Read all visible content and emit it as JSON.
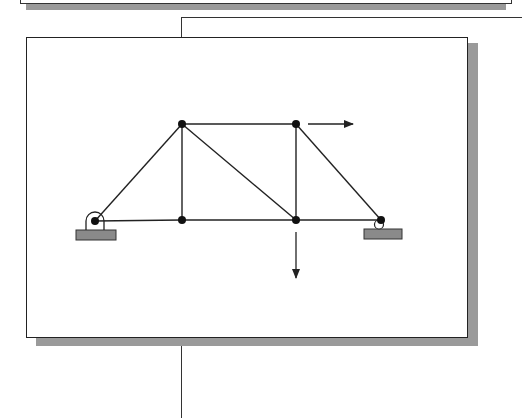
{
  "diagram": {
    "type": "truss",
    "colors": {
      "member": "#222222",
      "node": "#111111",
      "support": "#8a8a8a",
      "shadow": "#9a9a9a",
      "arrow": "#222222"
    },
    "nodes": [
      {
        "id": "A",
        "x": 95,
        "y": 221,
        "role": "pin-support"
      },
      {
        "id": "B",
        "x": 182,
        "y": 124
      },
      {
        "id": "C",
        "x": 182,
        "y": 220
      },
      {
        "id": "D",
        "x": 296,
        "y": 124
      },
      {
        "id": "E",
        "x": 296,
        "y": 220
      },
      {
        "id": "F",
        "x": 381,
        "y": 220,
        "role": "roller-support"
      }
    ],
    "members": [
      [
        "A",
        "B"
      ],
      [
        "A",
        "C"
      ],
      [
        "B",
        "C"
      ],
      [
        "B",
        "D"
      ],
      [
        "B",
        "E"
      ],
      [
        "C",
        "E"
      ],
      [
        "D",
        "E"
      ],
      [
        "D",
        "F"
      ],
      [
        "E",
        "F"
      ]
    ],
    "loads": [
      {
        "node": "D",
        "direction": "right",
        "x1": 308,
        "y1": 124,
        "x2": 353,
        "y2": 124
      },
      {
        "node": "E",
        "direction": "down",
        "x1": 296,
        "y1": 232,
        "x2": 296,
        "y2": 278
      }
    ]
  }
}
